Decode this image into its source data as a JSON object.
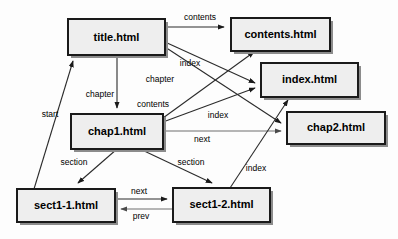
{
  "diagram": {
    "background_color": "#fdfdfd",
    "node_fill": "#eeeeee",
    "node_stroke": "#1a1a1a",
    "edge_color": "#2b2b2b",
    "nodes": [
      {
        "id": "title",
        "label": "title.html",
        "x": 68,
        "y": 19,
        "w": 97,
        "h": 36
      },
      {
        "id": "contents",
        "label": "contents.html",
        "x": 231,
        "y": 18,
        "w": 99,
        "h": 33
      },
      {
        "id": "index",
        "label": "index.html",
        "x": 261,
        "y": 63,
        "w": 97,
        "h": 34
      },
      {
        "id": "chap1",
        "label": "chap1.html",
        "x": 71,
        "y": 114,
        "w": 92,
        "h": 35
      },
      {
        "id": "chap2",
        "label": "chap2.html",
        "x": 287,
        "y": 112,
        "w": 98,
        "h": 32
      },
      {
        "id": "sect11",
        "label": "sect1-1.html",
        "x": 17,
        "y": 189,
        "w": 98,
        "h": 33
      },
      {
        "id": "sect12",
        "label": "sect1-2.html",
        "x": 173,
        "y": 188,
        "w": 97,
        "h": 34
      }
    ],
    "edges": [
      {
        "id": "title-contents",
        "from": "title",
        "to": "contents",
        "label": "contents",
        "label_x": 200,
        "label_y": 18
      },
      {
        "id": "title-index",
        "from": "title",
        "to": "index",
        "label": "index",
        "label_x": 190,
        "label_y": 64
      },
      {
        "id": "title-chap1",
        "from": "title",
        "to": "chap1",
        "label": "chapter",
        "label_x": 100,
        "label_y": 95
      },
      {
        "id": "title-chap2",
        "from": "title",
        "to": "chap2",
        "label": "chapter",
        "label_x": 160,
        "label_y": 80
      },
      {
        "id": "chap1-contents",
        "from": "chap1",
        "to": "contents",
        "label": "contents",
        "label_x": 153,
        "label_y": 105
      },
      {
        "id": "chap1-index",
        "from": "chap1",
        "to": "index",
        "label": "index",
        "label_x": 218,
        "label_y": 116
      },
      {
        "id": "chap1-chap2",
        "from": "chap1",
        "to": "chap2",
        "label": "next",
        "label_x": 202,
        "label_y": 140
      },
      {
        "id": "chap1-sect11",
        "from": "chap1",
        "to": "sect11",
        "label": "section",
        "label_x": 74,
        "label_y": 163
      },
      {
        "id": "chap1-sect12",
        "from": "chap1",
        "to": "sect12",
        "label": "section",
        "label_x": 191,
        "label_y": 163
      },
      {
        "id": "sect11-title",
        "from": "sect11",
        "to": "title",
        "label": "start",
        "label_x": 50,
        "label_y": 115
      },
      {
        "id": "sect11-sect12",
        "from": "sect11",
        "to": "sect12",
        "label": "next",
        "label_x": 139,
        "label_y": 192
      },
      {
        "id": "sect12-sect11",
        "from": "sect12",
        "to": "sect11",
        "label": "prev",
        "label_x": 141,
        "label_y": 217
      },
      {
        "id": "sect12-index",
        "from": "sect12",
        "to": "index",
        "label": "index",
        "label_x": 256,
        "label_y": 169
      }
    ]
  }
}
